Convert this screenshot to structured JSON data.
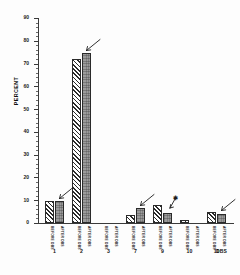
{
  "chart_data": {
    "type": "bar",
    "title": "",
    "subtitle": "",
    "xlabel": "",
    "ylabel": "PERCENT",
    "axis_caption": "DBS",
    "ylim": [
      0,
      90
    ],
    "ytick_step": 10,
    "yticks": [
      "0",
      "10",
      "20",
      "30",
      "40",
      "50",
      "60",
      "70",
      "80",
      "90"
    ],
    "grid": false,
    "legend_position": "none",
    "categories": [
      "1",
      "2",
      "3",
      "7",
      "9",
      "10",
      "11"
    ],
    "series": [
      {
        "name": "BEFORE",
        "pattern": "hatched",
        "values": [
          9.5,
          72.0,
          0.0,
          3.5,
          8.0,
          1.2,
          5.0
        ]
      },
      {
        "name": "AFTER",
        "pattern": "stippled-gray",
        "values": [
          9.5,
          74.5,
          0.0,
          6.5,
          4.5,
          0.2,
          4.0
        ]
      }
    ],
    "bar_captions": [
      [
        "BEFORE DBS",
        "AFTER DBS"
      ],
      [
        "BEFORE DBS",
        "AFTER DBS"
      ],
      [
        "BEFORE DBS",
        "AFTER DBS"
      ],
      [
        "BEFORE DBS",
        "AFTER DBS"
      ],
      [
        "BEFORE DBS",
        "AFTER DBS"
      ],
      [
        "BEFORE DBS",
        "AFTER DBS"
      ],
      [
        "BEFORE DBS",
        "AFTER DBS"
      ]
    ],
    "annotations": [
      {
        "name": "arrow-group-1",
        "target_group": "1",
        "target_series": "AFTER",
        "mark": "arrow"
      },
      {
        "name": "arrow-group-2",
        "target_group": "2",
        "target_series": "AFTER",
        "mark": "arrow"
      },
      {
        "name": "arrow-group-7",
        "target_group": "7",
        "target_series": "AFTER",
        "mark": "arrow"
      },
      {
        "name": "arrow-group-9",
        "target_group": "9",
        "target_series": "AFTER",
        "mark": "arrow-with-star"
      },
      {
        "name": "arrow-group-11",
        "target_group": "11",
        "target_series": "AFTER",
        "mark": "arrow"
      }
    ],
    "colors": {
      "bar_gray": "#9b9b9b",
      "bar_hatch": "#2b2b2b",
      "axis": "#3a3a3a",
      "background": "#fdfdfd",
      "text": "#151515"
    }
  }
}
